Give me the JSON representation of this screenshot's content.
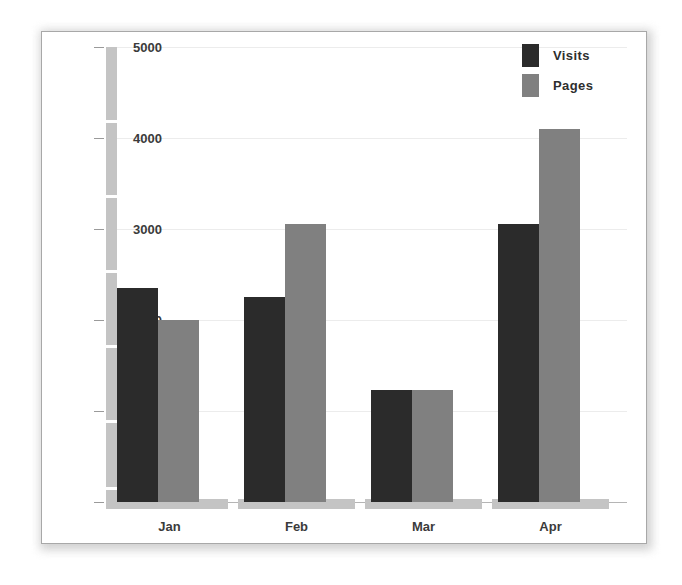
{
  "chart_data": {
    "type": "bar",
    "title": "",
    "xlabel": "",
    "ylabel": "",
    "categories": [
      "Jan",
      "Feb",
      "Mar",
      "Apr"
    ],
    "series": [
      {
        "name": "Visits",
        "color": "#2b2b2b",
        "values": [
          2350,
          2250,
          1230,
          3050
        ]
      },
      {
        "name": "Pages",
        "color": "#808080",
        "values": [
          2000,
          3050,
          1230,
          4100
        ]
      }
    ],
    "ylim": [
      0,
      5000
    ],
    "yticks": [
      0,
      1000,
      2000,
      3000,
      4000,
      5000
    ],
    "ytick_labels": [
      "0",
      "1000",
      "2000",
      "3000",
      "4000",
      "5000"
    ],
    "grid": true,
    "legend_position": "top-right"
  },
  "legend": {
    "entries": [
      {
        "label": "Visits",
        "color": "#2b2b2b"
      },
      {
        "label": "Pages",
        "color": "#808080"
      }
    ]
  },
  "axes": {
    "y_labels": [
      "5000",
      "4000",
      "3000",
      "2000",
      "1000",
      "0"
    ],
    "x_labels": [
      "Jan",
      "Feb",
      "Mar",
      "Apr"
    ]
  },
  "colors": {
    "visits": "#2b2b2b",
    "pages": "#808080",
    "gridline": "#ececec",
    "scrollbar": "#c4c4c4",
    "panel_border": "#a8a8a8",
    "background": "#ffffff",
    "text": "#3b3b3b"
  }
}
